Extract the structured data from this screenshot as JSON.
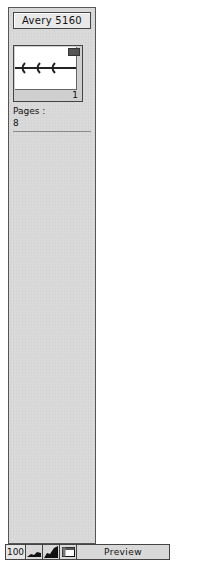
{
  "panel": {
    "title": "Avery 5160",
    "thumbnail": {
      "page_number": "1",
      "badge_icon": "page-badge-icon"
    },
    "pages_label": "Pages :",
    "pages_value": "8"
  },
  "bottom_bar": {
    "zoom_value": "100",
    "icons": [
      "small-mountain-icon",
      "large-mountain-icon",
      "window-icon"
    ],
    "preview_label": "Preview"
  }
}
